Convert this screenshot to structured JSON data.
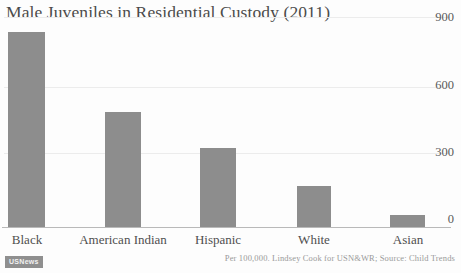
{
  "chart_data": {
    "type": "bar",
    "title": "Male Juveniles in Residential Custody (2011)",
    "categories": [
      "Black",
      "American Indian",
      "Hispanic",
      "White",
      "Asian"
    ],
    "values": [
      836,
      493,
      339,
      176,
      51
    ],
    "xlabel": "",
    "ylabel": "",
    "ylim": [
      0,
      900
    ],
    "yticks": [
      0,
      300,
      600,
      900
    ],
    "ytick_labels": [
      "0",
      "300",
      "600",
      "900"
    ],
    "y_axis_position": "right",
    "grid": true,
    "legend": false,
    "bar_color": "#8d8d8d",
    "background_color": "#fdfdfd",
    "gridline_color": "#ececec",
    "axis_color": "#b9b9b9",
    "annotations": {
      "source_note": "Per 100,000. Lindsey Cook for USN&WR; Source: Child Trends",
      "brand": "USNews"
    }
  },
  "ticks": {
    "y": [
      {
        "label": "900"
      },
      {
        "label": "600"
      },
      {
        "label": "300"
      },
      {
        "label": "0"
      }
    ],
    "x": [
      {
        "label": "Black"
      },
      {
        "label": "American Indian"
      },
      {
        "label": "Hispanic"
      },
      {
        "label": "White"
      },
      {
        "label": "Asian"
      }
    ]
  }
}
